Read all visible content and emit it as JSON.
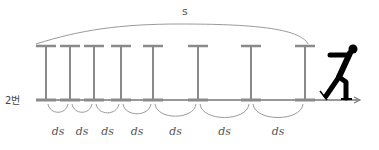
{
  "diagram": {
    "total_label": "s",
    "segment_label": "ds",
    "row_label": "2번",
    "pole_count": 8,
    "segment_labels": [
      "ds",
      "ds",
      "ds",
      "ds",
      "ds",
      "ds",
      "ds"
    ],
    "figure": "skater-icon",
    "colors": {
      "pole": "#8a8a8a",
      "arc": "#9a9a9a",
      "ground": "#777777",
      "figure": "#000000",
      "text": "#555555"
    }
  }
}
